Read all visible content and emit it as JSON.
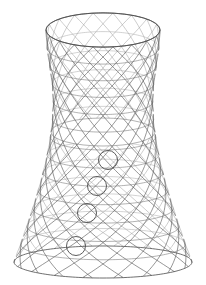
{
  "figure": {
    "background_color": "#ffffff",
    "line_color": "#5f5f5f",
    "back_line_color": "#a6a6a6",
    "rim_color": "#4a4a4a",
    "marker_color": "#4a4a4a"
  },
  "canvas": {
    "width": 206,
    "height": 285
  },
  "geometry": {
    "center_x": 103,
    "top_y": 30,
    "bottom_y": 262,
    "top_radius": 57,
    "bottom_radius": 89,
    "waist_radius": 50,
    "waist_t": 0.3,
    "ellipse_squash": 0.3,
    "bottom_squash": 0.18,
    "ring_count": 13,
    "helix_count": 18,
    "helix_twist": 0.62,
    "opening_inner_y": 132,
    "opening_inner_rx": 52,
    "opening_inner_ry": 14
  },
  "markers": [
    {
      "name": "marker-1",
      "cx": 108,
      "cy": 160,
      "r": 9.5
    },
    {
      "name": "marker-2",
      "cx": 97,
      "cy": 186,
      "r": 9.5
    },
    {
      "name": "marker-3",
      "cx": 87,
      "cy": 213,
      "r": 9.5
    },
    {
      "name": "marker-4",
      "cx": 76,
      "cy": 246,
      "r": 9.5
    }
  ]
}
